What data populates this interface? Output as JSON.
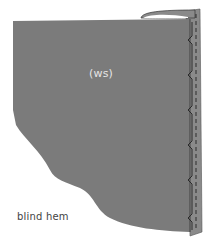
{
  "diagram": {
    "title": "blind hem",
    "fabric_label": "(ws)",
    "caption": "blind hem",
    "colors": {
      "fabric": "#7b7b7b",
      "fold_edge": "#8a8a8a",
      "fold_highlight": "#ffffff",
      "stitch": "#222222",
      "label": "#e6e6e6",
      "caption": "#444444",
      "background": "#ffffff"
    },
    "elements": [
      {
        "name": "fabric-panel",
        "description": "wrong side of fabric"
      },
      {
        "name": "folded-hem",
        "description": "hem allowance folded back along right edge"
      },
      {
        "name": "blind-stitch",
        "description": "zigzag blind stitching with dashed running line"
      }
    ],
    "stitch_points_y": [
      40,
      75,
      110,
      145,
      180,
      218
    ]
  }
}
